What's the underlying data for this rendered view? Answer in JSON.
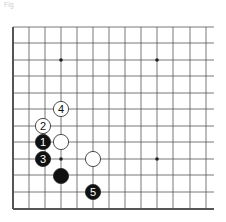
{
  "caption": "Fig",
  "board": {
    "columns_x": [
      13,
      29,
      45,
      61,
      77,
      93,
      109,
      125,
      141,
      157,
      173,
      190,
      206
    ],
    "rows_y": [
      27,
      43,
      60,
      76,
      93,
      109,
      126,
      142,
      159,
      175,
      192,
      209
    ],
    "right_extent": 214,
    "left_edge": true,
    "bottom_edge": true,
    "star_points": [
      [
        61,
        60
      ],
      [
        157,
        60
      ],
      [
        157,
        159
      ],
      [
        61,
        159
      ]
    ],
    "line_color": "#555555",
    "edge_color": "#333333"
  },
  "stones": [
    {
      "color": "white",
      "x": 61,
      "y": 109,
      "label": "4"
    },
    {
      "color": "white",
      "x": 43,
      "y": 126,
      "label": "2"
    },
    {
      "color": "black",
      "x": 43,
      "y": 142,
      "label": "1"
    },
    {
      "color": "white",
      "x": 61,
      "y": 142,
      "label": ""
    },
    {
      "color": "black",
      "x": 43,
      "y": 159,
      "label": "3"
    },
    {
      "color": "white",
      "x": 93,
      "y": 159,
      "label": ""
    },
    {
      "color": "black",
      "x": 61,
      "y": 176,
      "label": ""
    },
    {
      "color": "black",
      "x": 93,
      "y": 192,
      "label": "5"
    }
  ]
}
